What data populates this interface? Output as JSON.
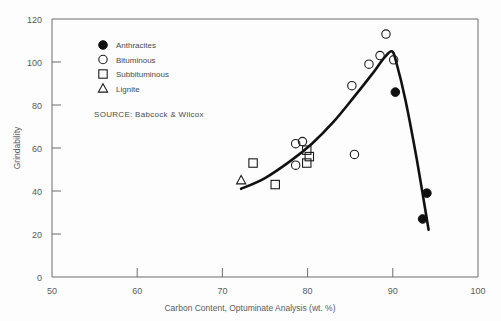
{
  "chart_data": {
    "type": "scatter",
    "title": "",
    "xlabel": "Carbon Content, Optuminate Analysis (wt. %)",
    "ylabel": "Grindability",
    "xlim": [
      50,
      100
    ],
    "ylim": [
      0,
      120
    ],
    "xticks": [
      50,
      60,
      70,
      80,
      90,
      100
    ],
    "yticks": [
      0,
      20,
      40,
      60,
      80,
      100,
      120
    ],
    "grid": false,
    "legend_position": "upper-left-inside",
    "source": "SOURCE:  Babcock & Wilcox",
    "series": [
      {
        "name": "Anthracites",
        "marker": "filled-circle",
        "points": [
          [
            90.3,
            86
          ],
          [
            94.0,
            39
          ],
          [
            93.5,
            27
          ]
        ]
      },
      {
        "name": "Bituminous",
        "marker": "open-circle",
        "points": [
          [
            78.6,
            62
          ],
          [
            79.4,
            63
          ],
          [
            78.6,
            52
          ],
          [
            85.2,
            89
          ],
          [
            87.2,
            99
          ],
          [
            88.5,
            103
          ],
          [
            89.2,
            113
          ],
          [
            90.1,
            101
          ],
          [
            85.5,
            57
          ]
        ]
      },
      {
        "name": "Subbituminous",
        "marker": "open-square",
        "points": [
          [
            73.6,
            53
          ],
          [
            76.2,
            43
          ],
          [
            79.9,
            59
          ],
          [
            79.9,
            53
          ],
          [
            80.2,
            56
          ]
        ]
      },
      {
        "name": "Lignite",
        "marker": "open-triangle",
        "points": [
          [
            72.2,
            45
          ]
        ]
      }
    ],
    "trend_curve": {
      "description": "hand-drawn trend rising from lignite region to a peak near 90% carbon, then falling steeply",
      "points": [
        [
          72.2,
          41
        ],
        [
          75.0,
          46
        ],
        [
          78.0,
          54
        ],
        [
          80.5,
          62
        ],
        [
          83.0,
          72
        ],
        [
          85.5,
          84
        ],
        [
          87.5,
          94
        ],
        [
          89.0,
          102
        ],
        [
          89.9,
          105
        ],
        [
          90.4,
          100
        ],
        [
          91.5,
          82
        ],
        [
          92.8,
          55
        ],
        [
          94.2,
          22
        ]
      ]
    },
    "legend_entries": [
      {
        "label": "Anthracites",
        "marker": "filled-circle"
      },
      {
        "label": "Bituminous",
        "marker": "open-circle"
      },
      {
        "label": "Subbituminous",
        "marker": "open-square"
      },
      {
        "label": "Lignite",
        "marker": "open-triangle"
      }
    ],
    "tick_labels_x": [
      "50",
      "60",
      "70",
      "80",
      "90",
      "100"
    ],
    "tick_labels_y": [
      "0",
      "20",
      "40",
      "60",
      "80",
      "100",
      "120"
    ],
    "colors": {
      "background": "#fdfdfd",
      "axis": "#6d6d6d",
      "marker": "#1b1b1b",
      "curve": "#111111",
      "text": "#4a4a4a"
    }
  }
}
